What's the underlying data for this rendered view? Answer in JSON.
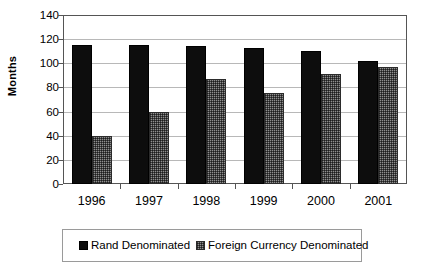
{
  "chart_data": {
    "type": "bar",
    "title": "",
    "xlabel": "",
    "ylabel": "Months",
    "categories": [
      "1996",
      "1997",
      "1998",
      "1999",
      "2000",
      "2001"
    ],
    "series": [
      {
        "name": "Rand Denominated",
        "values": [
          115,
          115,
          114,
          113,
          110,
          102
        ],
        "color": "#0d0d0d"
      },
      {
        "name": "Foreign Currency Denominated",
        "values": [
          40,
          60,
          87,
          75,
          91,
          97
        ],
        "color": "#8f8f8f"
      }
    ],
    "ylim": [
      0,
      140
    ],
    "ytick_labels": [
      "140",
      "120",
      "100",
      "80",
      "60",
      "40",
      "20",
      "0"
    ],
    "ytick_values": [
      140,
      120,
      100,
      80,
      60,
      40,
      20,
      0
    ],
    "grid": true,
    "legend_position": "bottom"
  },
  "legend": {
    "entries": [
      {
        "label": "Rand Denominated",
        "swatch": "black-square-icon"
      },
      {
        "label": "Foreign Currency Denominated",
        "swatch": "gray-checker-square-icon"
      }
    ]
  }
}
